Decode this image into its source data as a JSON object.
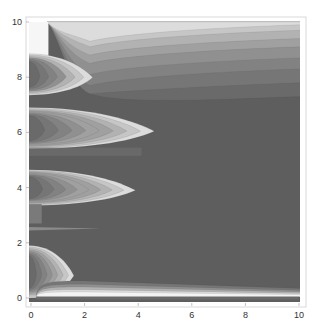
{
  "chart_data": {
    "type": "heatmap",
    "subtype": "contour",
    "title": "",
    "xlabel": "",
    "ylabel": "",
    "xlim": [
      0,
      10
    ],
    "ylim": [
      0,
      10
    ],
    "x_ticks": [
      "0",
      "2",
      "4",
      "6",
      "8",
      "10"
    ],
    "y_ticks": [
      "0",
      "2",
      "4",
      "6",
      "8",
      "10"
    ],
    "x_tick_values": [
      0,
      2,
      4,
      6,
      8,
      10
    ],
    "y_tick_values": [
      0,
      2,
      4,
      6,
      8,
      10
    ],
    "grid": false,
    "colormap": "grayscale (light = high, dark = low)",
    "background_level_color": "#5e5e5e",
    "features": [
      {
        "name": "top-band",
        "description": "light horizontal bands near y=10 fading to dark by y≈7.5 across x 1-10",
        "y_range": [
          7.3,
          10
        ]
      },
      {
        "name": "lobe-y8",
        "description": "light lobe at left edge",
        "center": [
          0,
          8.1
        ],
        "x_extent": 2.3
      },
      {
        "name": "lobe-y6.2",
        "description": "elongated light lobe",
        "center": [
          0,
          6.2
        ],
        "x_extent": 4.6
      },
      {
        "name": "lobe-y4",
        "description": "elongated light lobe",
        "center": [
          0,
          4.0
        ],
        "x_extent": 3.9
      },
      {
        "name": "streak-y2.5",
        "description": "thin light streak",
        "center": [
          0,
          2.5
        ],
        "x_extent": 2.6
      },
      {
        "name": "lobe-y1",
        "description": "light lobe at left edge",
        "center": [
          0,
          0.9
        ],
        "x_extent": 1.6
      },
      {
        "name": "bottom-band",
        "description": "light band along y≈0.2",
        "y_range": [
          0,
          0.6
        ]
      }
    ],
    "contour_levels": [
      "#f4f4f4",
      "#dcdcdc",
      "#c6c6c6",
      "#b2b2b2",
      "#a0a0a0",
      "#909090",
      "#828282",
      "#767676",
      "#6a6a6a",
      "#5e5e5e"
    ]
  }
}
